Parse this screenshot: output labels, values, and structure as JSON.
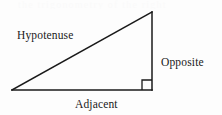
{
  "figure": {
    "name": "right-triangle-trigonometry-diagram",
    "background_color": "#fdfdfd",
    "stroke_color": "#1a1a1a",
    "text_color": "#1a1a1a",
    "width": 222,
    "height": 115
  },
  "labels": {
    "hypotenuse": "Hypotenuse",
    "opposite": "Opposite",
    "adjacent": "Adjacent"
  },
  "geometry": {
    "vertices": {
      "left": {
        "x": 12,
        "y": 90
      },
      "top_right": {
        "x": 152,
        "y": 12
      },
      "bottom_right": {
        "x": 152,
        "y": 90
      }
    },
    "sides": [
      {
        "name": "hypotenuse",
        "from": "left",
        "to": "top_right"
      },
      {
        "name": "opposite",
        "from": "top_right",
        "to": "bottom_right"
      },
      {
        "name": "adjacent",
        "from": "bottom_right",
        "to": "left"
      }
    ],
    "right_angle_marker": {
      "at": "bottom_right",
      "size": 10,
      "x": 142,
      "y": 80
    },
    "stroke_width": 1.5
  },
  "artifacts": {
    "scan_ghost_text": "the trigonometry of the right"
  }
}
